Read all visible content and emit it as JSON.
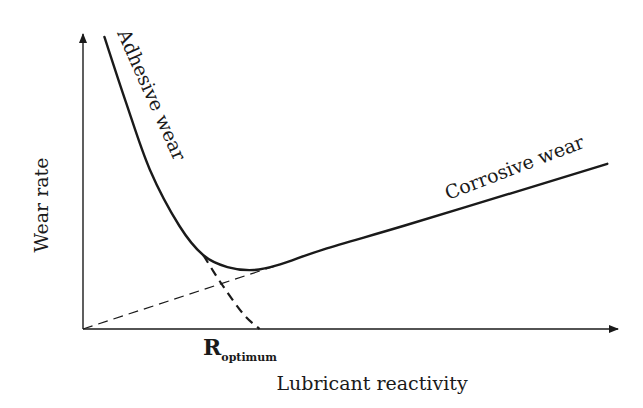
{
  "chart_data": {
    "type": "line",
    "title": "",
    "xlabel": "Lubricant reactivity",
    "ylabel": "Wear rate",
    "x_tick_label": {
      "main": "R",
      "subscript": "optimum",
      "x": 0.315
    },
    "xlim": [
      0,
      1
    ],
    "ylim": [
      0,
      1
    ],
    "grid": false,
    "legend": "none",
    "series": [
      {
        "name": "Total wear",
        "style": "solid",
        "x": [
          0.04,
          0.08,
          0.125,
          0.18,
          0.225,
          0.27,
          0.32,
          0.37,
          0.45,
          0.6,
          0.8,
          0.98
        ],
        "y": [
          0.99,
          0.77,
          0.54,
          0.35,
          0.25,
          0.21,
          0.2,
          0.22,
          0.27,
          0.35,
          0.46,
          0.56
        ]
      },
      {
        "name": "Adhesive wear (extrapolated)",
        "style": "dashed",
        "x": [
          0.225,
          0.26,
          0.3,
          0.33
        ],
        "y": [
          0.25,
          0.15,
          0.05,
          0.0
        ]
      },
      {
        "name": "Corrosive wear (extrapolated)",
        "style": "dashed",
        "x": [
          0.0,
          0.37
        ],
        "y": [
          0.0,
          0.22
        ]
      }
    ],
    "annotations": [
      {
        "text": "Adhesive wear",
        "near_series": "Total wear",
        "position": "upper-left branch"
      },
      {
        "text": "Corrosive wear",
        "near_series": "Total wear",
        "position": "upper-right branch"
      }
    ]
  }
}
